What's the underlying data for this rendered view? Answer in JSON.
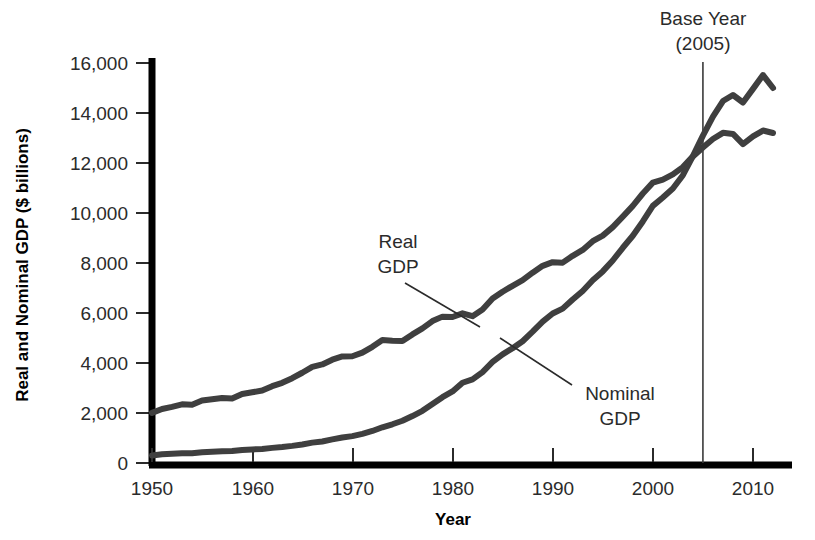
{
  "chart_data": {
    "type": "line",
    "title": "",
    "xlabel": "Year",
    "ylabel": "Real and Nominal GDP ($ billions)",
    "xlim": [
      1950,
      2012
    ],
    "ylim": [
      0,
      16000
    ],
    "xticks": [
      1950,
      1960,
      1970,
      1980,
      1990,
      2000,
      2010
    ],
    "xtick_labels": [
      "1950",
      "1960",
      "1970",
      "1980",
      "1990",
      "2000",
      "2010"
    ],
    "yticks": [
      0,
      2000,
      4000,
      6000,
      8000,
      10000,
      12000,
      14000,
      16000
    ],
    "ytick_labels": [
      "0",
      "2,000",
      "4,000",
      "6,000",
      "8,000",
      "10,000",
      "12,000",
      "14,000",
      "16,000"
    ],
    "grid": false,
    "legend_position": "inline-annotations",
    "line_color": "#3f3f3f",
    "series": [
      {
        "name": "Real GDP",
        "label": "Real\nGDP",
        "x": [
          1950,
          1951,
          1952,
          1953,
          1954,
          1955,
          1956,
          1957,
          1958,
          1959,
          1960,
          1961,
          1962,
          1963,
          1964,
          1965,
          1966,
          1967,
          1968,
          1969,
          1970,
          1971,
          1972,
          1973,
          1974,
          1975,
          1976,
          1977,
          1978,
          1979,
          1980,
          1981,
          1982,
          1983,
          1984,
          1985,
          1986,
          1987,
          1988,
          1989,
          1990,
          1991,
          1992,
          1993,
          1994,
          1995,
          1996,
          1997,
          1998,
          1999,
          2000,
          2001,
          2002,
          2003,
          2004,
          2005,
          2006,
          2007,
          2008,
          2009,
          2010,
          2011,
          2012
        ],
        "values": [
          2006,
          2161,
          2244,
          2347,
          2332,
          2500,
          2549,
          2601,
          2578,
          2762,
          2831,
          2897,
          3072,
          3207,
          3392,
          3610,
          3845,
          3942,
          4133,
          4262,
          4270,
          4413,
          4647,
          4917,
          4890,
          4880,
          5144,
          5382,
          5678,
          5855,
          5839,
          5987,
          5871,
          6136,
          6577,
          6849,
          7087,
          7313,
          7614,
          7886,
          8034,
          8015,
          8287,
          8523,
          8871,
          9094,
          9434,
          9854,
          10284,
          10780,
          11216,
          11338,
          11543,
          11836,
          12264,
          12623,
          12959,
          13206,
          13162,
          12758,
          13063,
          13299,
          13200
        ],
        "annotation": {
          "text_lines": [
            "Real",
            "GDP"
          ],
          "points_to_year": 1984
        }
      },
      {
        "name": "Nominal GDP",
        "label": "Nominal\nGDP",
        "x": [
          1950,
          1951,
          1952,
          1953,
          1954,
          1955,
          1956,
          1957,
          1958,
          1959,
          1960,
          1961,
          1962,
          1963,
          1964,
          1965,
          1966,
          1967,
          1968,
          1969,
          1970,
          1971,
          1972,
          1973,
          1974,
          1975,
          1976,
          1977,
          1978,
          1979,
          1980,
          1981,
          1982,
          1983,
          1984,
          1985,
          1986,
          1987,
          1988,
          1989,
          1990,
          1991,
          1992,
          1993,
          1994,
          1995,
          1996,
          1997,
          1998,
          1999,
          2000,
          2001,
          2002,
          2003,
          2004,
          2005,
          2006,
          2007,
          2008,
          2009,
          2010,
          2011,
          2012
        ],
        "values": [
          300,
          347,
          367,
          389,
          391,
          426,
          450,
          474,
          481,
          522,
          543,
          563,
          605,
          638,
          685,
          743,
          815,
          862,
          943,
          1020,
          1076,
          1168,
          1282,
          1429,
          1549,
          1689,
          1878,
          2086,
          2357,
          2632,
          2863,
          3211,
          3345,
          3638,
          4041,
          4347,
          4590,
          4870,
          5253,
          5658,
          5980,
          6174,
          6539,
          6879,
          7309,
          7664,
          8100,
          8609,
          9089,
          9661,
          10285,
          10622,
          10978,
          11511,
          12275,
          13094,
          13856,
          14478,
          14719,
          14419,
          14964,
          15518,
          15000
        ],
        "annotation": {
          "text_lines": [
            "Nominal",
            "GDP"
          ],
          "points_to_year": 1990
        }
      }
    ],
    "annotations": [
      {
        "name": "base-year",
        "text_lines": [
          "Base Year",
          "(2005)"
        ],
        "year": 2005
      }
    ]
  },
  "labels": {
    "y_axis_title": "Real and Nominal GDP ($ billions)",
    "x_axis_title": "Year",
    "base_year_line1": "Base Year",
    "base_year_line2": "(2005)",
    "real_gdp_line1": "Real",
    "real_gdp_line2": "GDP",
    "nominal_gdp_line1": "Nominal",
    "nominal_gdp_line2": "GDP"
  }
}
